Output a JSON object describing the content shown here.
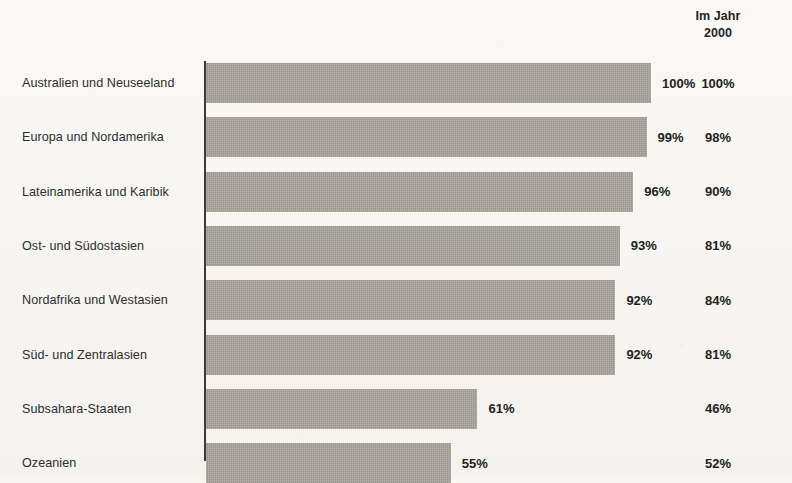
{
  "header": {
    "right_column_line1": "Im Jahr",
    "right_column_line2": "2000"
  },
  "colors": {
    "bar": "#a8a49c",
    "background": "#f7f6f3",
    "text": "#2b2b2b",
    "axis": "#3a3a3a"
  },
  "chart_data": {
    "type": "bar",
    "orientation": "horizontal",
    "title": "",
    "subtitle": "",
    "xlabel": "",
    "ylabel": "",
    "xlim": [
      0,
      100
    ],
    "grid": false,
    "legend": false,
    "value_suffix": "%",
    "categories": [
      "Australien und Neuseeland",
      "Europa und Nordamerika",
      "Lateinamerika und Karibik",
      "Ost- und Südostasien",
      "Nordafrika und Westasien",
      "Süd- und Zentralasien",
      "Subsahara-Staaten",
      "Ozeanien"
    ],
    "series": [
      {
        "name": "",
        "drawn_as": "bar",
        "values": [
          100,
          99,
          96,
          93,
          92,
          92,
          61,
          55
        ],
        "labels": [
          "100%",
          "99%",
          "96%",
          "93%",
          "92%",
          "92%",
          "61%",
          "55%"
        ]
      },
      {
        "name": "Im Jahr 2000",
        "drawn_as": "text-column",
        "values": [
          100,
          98,
          90,
          81,
          84,
          81,
          46,
          52
        ],
        "labels": [
          "100%",
          "98%",
          "90%",
          "81%",
          "84%",
          "81%",
          "46%",
          "52%"
        ]
      }
    ]
  }
}
